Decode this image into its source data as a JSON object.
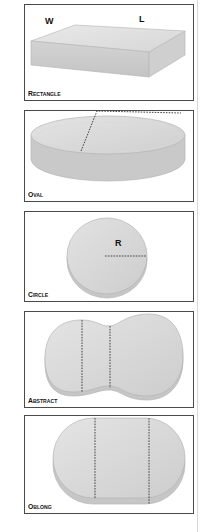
{
  "shapes": [
    {
      "id": "rectangle",
      "label": "Rectangle",
      "dimensions": [
        "W",
        "L"
      ]
    },
    {
      "id": "oval",
      "label": "Oval"
    },
    {
      "id": "circle",
      "label": "Circle",
      "dimensions": [
        "R"
      ]
    },
    {
      "id": "abstract",
      "label": "Abstract"
    },
    {
      "id": "oblong",
      "label": "Oblong"
    }
  ]
}
